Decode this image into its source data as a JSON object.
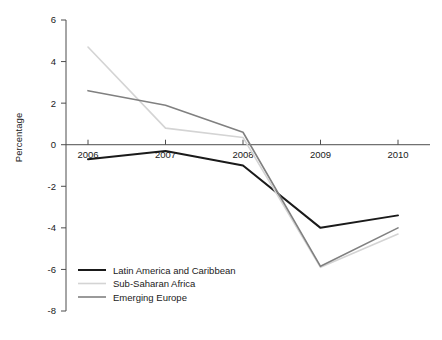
{
  "chart_data": {
    "type": "line",
    "title": "",
    "xlabel": "",
    "ylabel": "Percentage",
    "categories": [
      "2006",
      "2007",
      "2008",
      "2009",
      "2010"
    ],
    "x": [
      2006,
      2007,
      2008,
      2009,
      2010
    ],
    "xlim": [
      2006,
      2010
    ],
    "ylim": [
      -8,
      6
    ],
    "yticks": [
      6,
      4,
      2,
      0,
      -2,
      -4,
      -6,
      -8
    ],
    "ytick_labels": [
      "6",
      "4",
      "2",
      "0",
      "-2",
      "-4",
      "-6",
      "-8"
    ],
    "xticks": [
      2006,
      2007,
      2008,
      2009,
      2010
    ],
    "xtick_labels": [
      "2006",
      "2007",
      "2008",
      "2009",
      "2010"
    ],
    "grid": false,
    "legend_position": "bottom-left",
    "series": [
      {
        "name": "Latin America and Caribbean",
        "color": "#1a1a1a",
        "width": 2.0,
        "values": [
          -0.7,
          -0.3,
          -1.0,
          -4.0,
          -3.4
        ]
      },
      {
        "name": "Sub-Saharan Africa",
        "color": "#d4d4d4",
        "width": 1.6,
        "values": [
          4.7,
          0.8,
          0.35,
          -5.9,
          -4.3
        ]
      },
      {
        "name": "Emerging Europe",
        "color": "#808080",
        "width": 1.6,
        "values": [
          2.6,
          1.9,
          0.6,
          -5.85,
          -4.0
        ]
      }
    ]
  },
  "axis": {
    "y_label": "Percentage"
  },
  "legend": {
    "entries": [
      {
        "label": "Latin America and Caribbean",
        "color": "#1a1a1a",
        "width": 2.0
      },
      {
        "label": "Sub-Saharan Africa",
        "color": "#d4d4d4",
        "width": 1.6
      },
      {
        "label": "Emerging Europe",
        "color": "#808080",
        "width": 1.6
      }
    ]
  },
  "colors": {
    "axis": "#4d4d4d",
    "zero_line": "#4d4d4d",
    "text": "#1a1a1a",
    "background": "#ffffff"
  }
}
